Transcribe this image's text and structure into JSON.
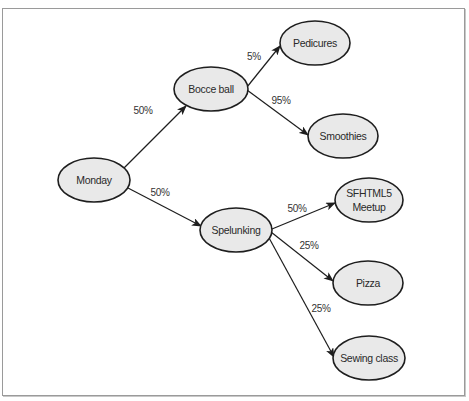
{
  "diagram": {
    "type": "probability-tree",
    "nodes": [
      {
        "id": "monday",
        "label": "Monday",
        "cx": 94,
        "cy": 180,
        "rx": 36,
        "ry": 22
      },
      {
        "id": "bocce",
        "label": "Bocce ball",
        "cx": 211,
        "cy": 89,
        "rx": 37,
        "ry": 22
      },
      {
        "id": "spelunking",
        "label": "Spelunking",
        "cx": 236,
        "cy": 230,
        "rx": 36,
        "ry": 22
      },
      {
        "id": "pedicures",
        "label": "Pedicures",
        "cx": 315,
        "cy": 43,
        "rx": 35,
        "ry": 22
      },
      {
        "id": "smoothies",
        "label": "Smoothies",
        "cx": 343,
        "cy": 136,
        "rx": 35,
        "ry": 22
      },
      {
        "id": "sfhtml5",
        "label_line1": "SFHTML5",
        "label_line2": "Meetup",
        "cx": 369,
        "cy": 200,
        "rx": 34,
        "ry": 22
      },
      {
        "id": "pizza",
        "label": "Pizza",
        "cx": 368,
        "cy": 283,
        "rx": 35,
        "ry": 22
      },
      {
        "id": "sewing",
        "label": "Sewing class",
        "cx": 369,
        "cy": 358,
        "rx": 36,
        "ry": 22
      }
    ],
    "edges": [
      {
        "from": "monday",
        "to": "bocce",
        "label": "50%"
      },
      {
        "from": "monday",
        "to": "spelunking",
        "label": "50%"
      },
      {
        "from": "bocce",
        "to": "pedicures",
        "label": "5%"
      },
      {
        "from": "bocce",
        "to": "smoothies",
        "label": "95%"
      },
      {
        "from": "spelunking",
        "to": "sfhtml5",
        "label": "50%"
      },
      {
        "from": "spelunking",
        "to": "pizza",
        "label": "25%"
      },
      {
        "from": "spelunking",
        "to": "sewing",
        "label": "25%"
      }
    ],
    "colors": {
      "node_fill": "#e9e9e9",
      "node_stroke": "#1e1e1e",
      "edge": "#1e1e1e",
      "frame": "#9a9a9a"
    }
  }
}
